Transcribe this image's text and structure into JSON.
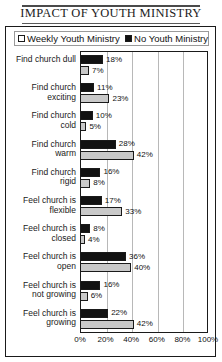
{
  "title": "IMPACT OF YOUTH MINISTRY",
  "legend": {
    "items": [
      {
        "label": "Weekly Youth Ministry",
        "swatch": "open-square-icon",
        "color": "#ffffff"
      },
      {
        "label": "No Youth Ministry",
        "swatch": "filled-square-icon",
        "color": "#111111"
      }
    ]
  },
  "chart_data": {
    "type": "bar",
    "orientation": "horizontal",
    "title": "IMPACT OF YOUTH MINISTRY",
    "xlabel": "",
    "ylabel": "",
    "xlim": [
      0,
      100
    ],
    "xticks": [
      "0%",
      "20%",
      "40%",
      "60%",
      "80%",
      "100%"
    ],
    "xtick_values": [
      0,
      20,
      40,
      60,
      80,
      100
    ],
    "grid": true,
    "legend_position": "top",
    "value_suffix": "%",
    "categories": [
      "Find church dull",
      "Find church exciting",
      "Find church cold",
      "Find church warm",
      "Find church rigid",
      "Feel church is flexible",
      "Feel church is closed",
      "Feel church is open",
      "Feel church is not growing",
      "Feel church is growing"
    ],
    "series": [
      {
        "name": "No Youth Ministry",
        "color": "#121212",
        "values": [
          18,
          11,
          10,
          28,
          16,
          17,
          8,
          36,
          16,
          22
        ]
      },
      {
        "name": "Weekly Youth Ministry",
        "color": "#c9c9c9",
        "values": [
          7,
          23,
          5,
          42,
          8,
          33,
          4,
          40,
          6,
          42
        ]
      }
    ],
    "labels": {
      "no_youth_ministry": [
        "18%",
        "11%",
        "10%",
        "28%",
        "16%",
        "17%",
        "8%",
        "36%",
        "16%",
        "22%"
      ],
      "weekly_youth_ministry": [
        "7%",
        "23%",
        "5%",
        "42%",
        "8%",
        "33%",
        "4%",
        "40%",
        "6%",
        "42%"
      ]
    }
  }
}
